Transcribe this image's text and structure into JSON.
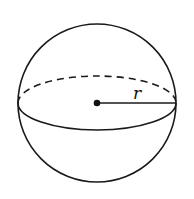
{
  "diagram": {
    "shape": "sphere",
    "stroke_color": "#1a1a1a",
    "background": "#ffffff",
    "sphere": {
      "cx": 97,
      "cy": 103,
      "r": 79
    },
    "equator": {
      "rx": 79,
      "ry": 27,
      "front_style": "solid",
      "back_style": "dashed"
    },
    "center_point": {
      "x": 97,
      "y": 103
    },
    "radius_segment": {
      "from": [
        97,
        103
      ],
      "to": [
        176,
        103
      ]
    },
    "labels": {
      "radius": "r"
    }
  }
}
